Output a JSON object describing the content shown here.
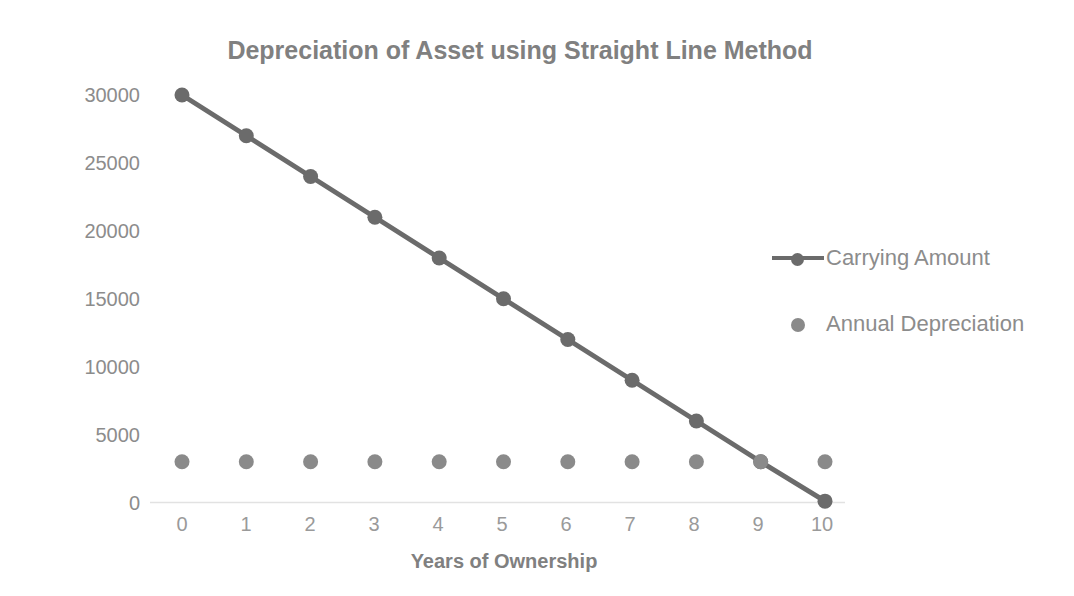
{
  "chart_data": {
    "type": "line",
    "title": "Depreciation of Asset using Straight Line Method",
    "xlabel": "Years of Ownership",
    "ylabel": "",
    "x": [
      0,
      1,
      2,
      3,
      4,
      5,
      6,
      7,
      8,
      9,
      10
    ],
    "xtick_labels": [
      "0",
      "1",
      "2",
      "3",
      "4",
      "5",
      "6",
      "7",
      "8",
      "9",
      "10"
    ],
    "ytick_labels": [
      "0",
      "5000",
      "10000",
      "15000",
      "20000",
      "25000",
      "30000"
    ],
    "yticks": [
      0,
      5000,
      10000,
      15000,
      20000,
      25000,
      30000
    ],
    "xlim": [
      0,
      10
    ],
    "ylim": [
      0,
      30000
    ],
    "grid": false,
    "legend_position": "right",
    "series": [
      {
        "name": "Carrying Amount",
        "marker": "circle",
        "line": true,
        "color": "#6b6b6b",
        "values": [
          30000,
          27000,
          24000,
          21000,
          18000,
          15000,
          12000,
          9000,
          6000,
          3000,
          100
        ]
      },
      {
        "name": "Annual Depreciation",
        "marker": "circle",
        "line": false,
        "color": "#8a8a8a",
        "values": [
          3000,
          3000,
          3000,
          3000,
          3000,
          3000,
          3000,
          3000,
          3000,
          3000,
          3000
        ]
      }
    ]
  },
  "legend": {
    "items": [
      {
        "label": "Carrying Amount"
      },
      {
        "label": "Annual Depreciation"
      }
    ]
  },
  "colors": {
    "series_primary": "#6b6b6b",
    "series_secondary": "#8a8a8a",
    "title_text": "#808080",
    "tick_text": "#8c8c8c",
    "axis_line": "#e2e2e2"
  }
}
